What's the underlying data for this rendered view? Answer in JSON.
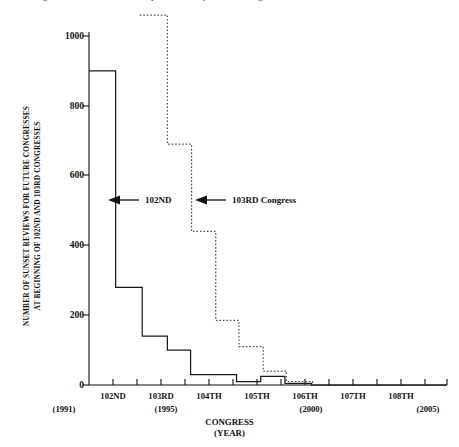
{
  "title": {
    "text": "Figure 1: Sunset Review Requirements by Future Congresses",
    "clipped": true
  },
  "axes": {
    "y_title_line1": "NUMBER OF SUNSET REVIEWS FOR FUTURE CONGRESSES",
    "y_title_line2": "AT BEGINNING OF 102ND AND 103RD CONGRESSES",
    "x_title_line1": "CONGRESS",
    "x_title_line2": "(YEAR)",
    "y_ticks": [
      "0",
      "200",
      "400",
      "600",
      "800",
      "1000"
    ],
    "x_ticks": [
      "102ND",
      "103RD",
      "104TH",
      "105TH",
      "106TH",
      "107TH",
      "108TH"
    ],
    "x_years": [
      {
        "label": "(1991)",
        "under": "102ND"
      },
      {
        "label": "(1995)",
        "under": "103RD"
      },
      {
        "label": "(2000)",
        "under": "106TH"
      },
      {
        "label": "(2005)",
        "under": "108TH"
      }
    ]
  },
  "annotations": [
    {
      "id": "annot-102nd",
      "text": "102ND",
      "icon": "left-arrow-icon"
    },
    {
      "id": "annot-103rd",
      "text": "103RD Congress",
      "icon": "left-arrow-icon"
    }
  ],
  "colors": {
    "ink": "#111111",
    "background": "#ffffff",
    "series_102nd": "#1a1a1a",
    "series_103rd": "#4d4d4d"
  },
  "chart_data": {
    "type": "line",
    "subtype": "step-post",
    "title": "Figure 1: Sunset Review Requirements by Future Congresses",
    "xlabel": "CONGRESS (YEAR)",
    "ylabel": "NUMBER OF SUNSET REVIEWS FOR FUTURE CONGRESSES AT BEGINNING OF 102ND AND 103RD CONGRESSES",
    "categories": [
      "102ND",
      "103RD",
      "104TH",
      "105TH",
      "106TH",
      "107TH",
      "108TH"
    ],
    "category_years": [
      "1991",
      "1993",
      "1995",
      "1997",
      "1999",
      "2001",
      "2003"
    ],
    "xlim": [
      0,
      7.4
    ],
    "ylim": [
      0,
      1060
    ],
    "y_ticks": [
      0,
      200,
      400,
      600,
      800,
      1000
    ],
    "grid": false,
    "legend": "inline-annotations",
    "series": [
      {
        "name": "102ND",
        "style": "solid",
        "color": "#1a1a1a",
        "step_values": [
          900,
          280,
          140,
          100,
          30,
          10,
          25,
          5
        ],
        "steps": [
          {
            "x_from": 0.0,
            "x_to": 0.55,
            "value": 900
          },
          {
            "x_from": 0.55,
            "x_to": 1.1,
            "value": 280
          },
          {
            "x_from": 1.1,
            "x_to": 1.62,
            "value": 140
          },
          {
            "x_from": 1.62,
            "x_to": 2.1,
            "value": 100
          },
          {
            "x_from": 2.1,
            "x_to": 3.05,
            "value": 30
          },
          {
            "x_from": 3.05,
            "x_to": 3.55,
            "value": 10
          },
          {
            "x_from": 3.55,
            "x_to": 4.05,
            "value": 25
          },
          {
            "x_from": 4.05,
            "x_to": 4.6,
            "value": 5
          },
          {
            "x_from": 4.6,
            "x_to": 7.4,
            "value": 0
          }
        ]
      },
      {
        "name": "103RD Congress",
        "style": "dotted",
        "color": "#4d4d4d",
        "step_values": [
          1060,
          690,
          440,
          185,
          110,
          40,
          10
        ],
        "steps": [
          {
            "x_from": 1.05,
            "x_to": 1.62,
            "value": 1060
          },
          {
            "x_from": 1.62,
            "x_to": 2.12,
            "value": 690
          },
          {
            "x_from": 2.12,
            "x_to": 2.62,
            "value": 440
          },
          {
            "x_from": 2.62,
            "x_to": 3.1,
            "value": 185
          },
          {
            "x_from": 3.1,
            "x_to": 3.6,
            "value": 110
          },
          {
            "x_from": 3.6,
            "x_to": 4.08,
            "value": 40
          },
          {
            "x_from": 4.08,
            "x_to": 4.62,
            "value": 10
          },
          {
            "x_from": 4.62,
            "x_to": 7.4,
            "value": 0
          }
        ]
      }
    ]
  }
}
